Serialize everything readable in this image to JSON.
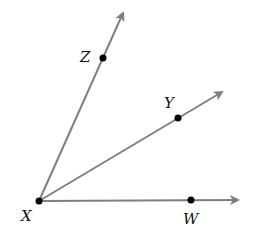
{
  "diagram": {
    "type": "rays-from-common-vertex",
    "colors": {
      "ray": "#7f7f7f",
      "point": "#000000",
      "label": "#111111",
      "background": "#ffffff"
    },
    "vertex": {
      "id": "X",
      "label": "X",
      "x": 39,
      "y": 201,
      "label_x": 21,
      "label_y": 220
    },
    "rays": [
      {
        "id": "XZ",
        "end_x": 123,
        "end_y": 13,
        "point": {
          "label": "Z",
          "x": 103,
          "y": 58,
          "label_x": 80,
          "label_y": 61
        }
      },
      {
        "id": "XY",
        "end_x": 222,
        "end_y": 92,
        "point": {
          "label": "Y",
          "x": 178,
          "y": 118,
          "label_x": 164,
          "label_y": 107
        }
      },
      {
        "id": "XW",
        "end_x": 238,
        "end_y": 200,
        "point": {
          "label": "W",
          "x": 191,
          "y": 200,
          "label_x": 184,
          "label_y": 223
        }
      }
    ]
  }
}
